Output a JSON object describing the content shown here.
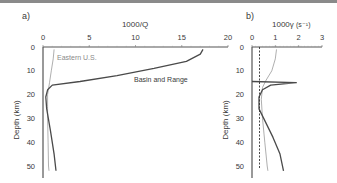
{
  "chart_data": [
    {
      "panel": "a)",
      "type": "line",
      "title": "1000/Q",
      "xlabel": "1000/Q",
      "ylabel": "Depth (km)",
      "xlim": [
        0,
        20
      ],
      "ylim": [
        0,
        53
      ],
      "y_inverted": true,
      "x_axis_position": "top",
      "xticks": [
        0,
        5,
        10,
        15,
        20
      ],
      "yticks": [
        0,
        10,
        20,
        30,
        40,
        50
      ],
      "grid": false,
      "series": [
        {
          "name": "Eastern U.S.",
          "color": "#9a9a9a",
          "points": [
            [
              1.2,
              1
            ],
            [
              1.1,
              5
            ],
            [
              0.9,
              10
            ],
            [
              0.7,
              15
            ],
            [
              0.5,
              20
            ],
            [
              0.5,
              25
            ],
            [
              0.5,
              30
            ],
            [
              0.55,
              40
            ],
            [
              0.6,
              50
            ],
            [
              0.65,
              52
            ]
          ]
        },
        {
          "name": "Basin and Range",
          "color": "#4a4a4a",
          "points": [
            [
              17.3,
              1
            ],
            [
              17.0,
              3
            ],
            [
              15.5,
              6
            ],
            [
              12.0,
              9
            ],
            [
              8.0,
              12
            ],
            [
              4.0,
              14.5
            ],
            [
              1.0,
              16
            ],
            [
              0.5,
              18
            ],
            [
              0.3,
              21
            ],
            [
              0.4,
              26
            ],
            [
              0.8,
              35
            ],
            [
              1.2,
              45
            ],
            [
              1.4,
              52
            ]
          ]
        }
      ],
      "annotations": [
        "Eastern U.S.",
        "Basin and Range"
      ]
    },
    {
      "panel": "b)",
      "type": "line",
      "title": "1000γ (s⁻¹)",
      "xlabel": "1000γ (s⁻¹)",
      "ylabel": "Depth (km)",
      "xlim": [
        0,
        3
      ],
      "ylim": [
        0,
        53
      ],
      "y_inverted": true,
      "x_axis_position": "top",
      "xticks": [
        0,
        1,
        2,
        3
      ],
      "yticks": [
        0,
        10,
        20,
        30,
        40,
        50
      ],
      "grid": false,
      "series": [
        {
          "name": "Eastern U.S.",
          "color": "#9a9a9a",
          "points": [
            [
              1.05,
              1
            ],
            [
              1.0,
              5
            ],
            [
              0.85,
              10
            ],
            [
              0.6,
              14
            ],
            [
              0.45,
              17
            ],
            [
              0.4,
              22
            ],
            [
              0.45,
              30
            ],
            [
              0.55,
              40
            ],
            [
              0.65,
              50
            ],
            [
              0.68,
              52
            ]
          ]
        },
        {
          "name": "Basin and Range",
          "color": "#4a4a4a",
          "points": [
            [
              0,
              14.5
            ],
            [
              1.9,
              15
            ],
            [
              0.8,
              16
            ],
            [
              0.45,
              18
            ],
            [
              0.3,
              21
            ],
            [
              0.3,
              26
            ],
            [
              0.5,
              30
            ],
            [
              0.9,
              38
            ],
            [
              1.2,
              45
            ],
            [
              1.35,
              52
            ]
          ]
        },
        {
          "name": "reference (dashed)",
          "color": "#333333",
          "style": "dashed",
          "points": [
            [
              0.32,
              0
            ],
            [
              0.32,
              51
            ]
          ]
        }
      ]
    }
  ],
  "labels": {
    "panel_a": "a)",
    "panel_b": "b)",
    "a_xlabel": "1000/Q",
    "b_xlabel_main": "1000γ",
    "b_xlabel_unit": "(s⁻¹)",
    "ylabel": "Depth (km)",
    "eastern": "Eastern U.S.",
    "basin": "Basin and Range"
  }
}
